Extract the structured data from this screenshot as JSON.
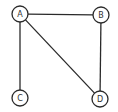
{
  "diagram": {
    "type": "undirected-graph",
    "node_radius": 8,
    "stroke_color": "#2a2a2a",
    "background_color": "#ffffff",
    "nodes": [
      {
        "id": "A",
        "label": "A",
        "x": 20,
        "y": 14
      },
      {
        "id": "B",
        "label": "B",
        "x": 101,
        "y": 15
      },
      {
        "id": "C",
        "label": "C",
        "x": 20,
        "y": 98
      },
      {
        "id": "D",
        "label": "D",
        "x": 100,
        "y": 99
      }
    ],
    "edges": [
      {
        "from": "A",
        "to": "B"
      },
      {
        "from": "A",
        "to": "C"
      },
      {
        "from": "A",
        "to": "D"
      },
      {
        "from": "B",
        "to": "D"
      }
    ]
  }
}
